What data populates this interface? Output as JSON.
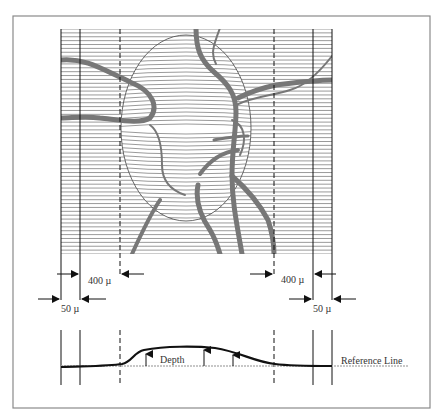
{
  "figure": {
    "frame_color": "#8a8a8a",
    "grid": {
      "left": 61,
      "right": 332,
      "top": 29,
      "bottom": 254,
      "line_count": 58,
      "line_color": "#555555"
    },
    "verticals": {
      "outer_left": 61,
      "inner_left": 80,
      "dashed_left": 120,
      "dashed_right": 274,
      "inner_right": 313,
      "outer_right": 332
    },
    "vessel_color": "#777777",
    "disc_outline_color": "#444444"
  },
  "dimensions": {
    "left_400": "400 µ",
    "right_400": "400 µ",
    "left_50": "50 µ",
    "right_50": "50 µ"
  },
  "profile": {
    "depth_label": "Depth",
    "reference_label": "Reference Line",
    "reference_color": "#b5b5b5",
    "curve_color": "#111111"
  }
}
